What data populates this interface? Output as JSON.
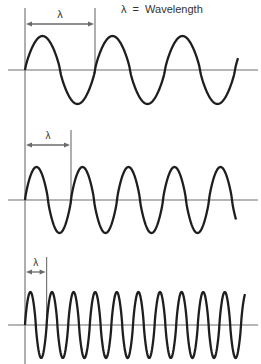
{
  "legend": {
    "symbol": "λ",
    "equals": "=",
    "text": "Wavelength"
  },
  "colors": {
    "background": "#ffffff",
    "wave": "#1e1e1e",
    "guide_lines": "#7a7a7a"
  },
  "waves": [
    {
      "name": "long-wavelength",
      "label": "λ",
      "axis_y": 70,
      "amplitude": 34,
      "start_x": 25,
      "wavelength_px": 70,
      "cycles_full": 3,
      "end_x": 238,
      "marker_top_y": 8,
      "arrow_y": 24,
      "label_y": 18
    },
    {
      "name": "medium-wavelength",
      "label": "λ",
      "axis_y": 200,
      "amplitude": 33,
      "start_x": 25,
      "wavelength_px": 46,
      "cycles_full": 4,
      "end_x": 236,
      "marker_top_y": 130,
      "arrow_y": 145,
      "label_y": 139
    },
    {
      "name": "short-wavelength",
      "label": "λ",
      "axis_y": 325,
      "amplitude": 33,
      "start_x": 25,
      "wavelength_px": 21.6,
      "cycles_full": 10,
      "end_x": 245,
      "marker_top_y": 257,
      "arrow_y": 272,
      "label_y": 266
    }
  ]
}
